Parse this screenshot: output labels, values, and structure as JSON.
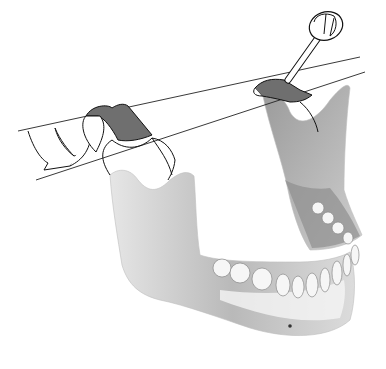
{
  "image": {
    "subject": "mandible-with-condylar-bands-and-instrument",
    "width": 386,
    "height": 369,
    "colors": {
      "background": "#ffffff",
      "bone_light": "#f2f2f2",
      "bone_mid": "#c9c9c9",
      "bone_dark": "#8c8c8c",
      "band": "#6e6e6e",
      "outline": "#111111"
    },
    "elements": [
      "left-condyle-band",
      "right-condyle-band",
      "rotation-arrow",
      "axis-lines",
      "driver-instrument",
      "mandible",
      "teeth",
      "mental-foramen"
    ]
  }
}
